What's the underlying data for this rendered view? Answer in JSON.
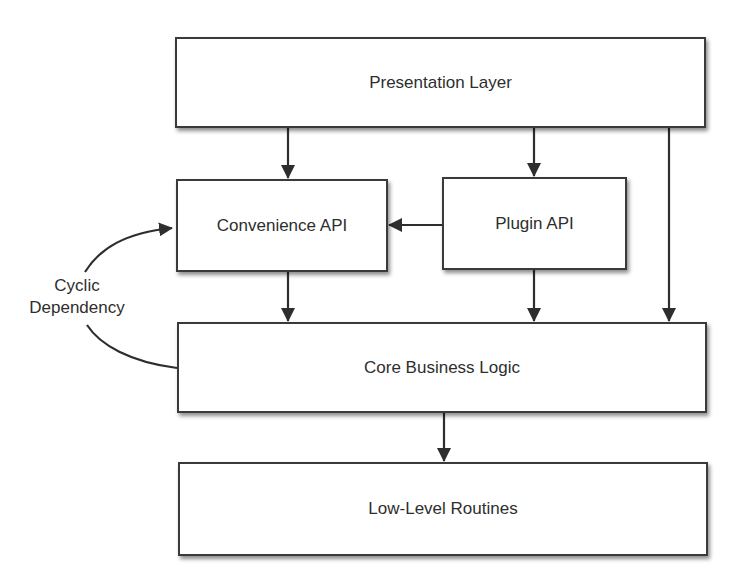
{
  "diagram": {
    "layers": {
      "presentation": "Presentation Layer",
      "convenience_api": "Convenience API",
      "plugin_api": "Plugin API",
      "core_business_logic": "Core Business Logic",
      "low_level_routines": "Low-Level Routines"
    },
    "annotation": {
      "line1": "Cyclic",
      "line2": "Dependency"
    },
    "edges": [
      {
        "from": "Presentation Layer",
        "to": "Convenience API"
      },
      {
        "from": "Presentation Layer",
        "to": "Plugin API"
      },
      {
        "from": "Presentation Layer",
        "to": "Core Business Logic"
      },
      {
        "from": "Plugin API",
        "to": "Convenience API"
      },
      {
        "from": "Convenience API",
        "to": "Core Business Logic"
      },
      {
        "from": "Plugin API",
        "to": "Core Business Logic"
      },
      {
        "from": "Core Business Logic",
        "to": "Convenience API",
        "label": "Cyclic Dependency"
      },
      {
        "from": "Core Business Logic",
        "to": "Low-Level Routines"
      }
    ],
    "colors": {
      "stroke": "#2e2e2e",
      "box_fill": "#ffffff",
      "text": "#2e2e2e"
    }
  }
}
